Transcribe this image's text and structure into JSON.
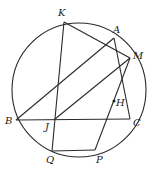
{
  "diagram": {
    "circle": {
      "cx": 79,
      "cy": 90,
      "r": 67
    },
    "points": {
      "K": {
        "label": "K",
        "x": 64,
        "y": 22,
        "lx": 58,
        "ly": 16
      },
      "A": {
        "label": "A",
        "x": 114,
        "y": 38,
        "lx": 113,
        "ly": 33
      },
      "M": {
        "label": "M",
        "x": 130,
        "y": 58,
        "lx": 133,
        "ly": 59
      },
      "B": {
        "label": "B",
        "x": 16,
        "y": 120,
        "lx": 5,
        "ly": 124
      },
      "C": {
        "label": "C",
        "x": 130,
        "y": 119,
        "lx": 133,
        "ly": 126
      },
      "J": {
        "label": "J",
        "x": 55,
        "y": 119,
        "lx": 45,
        "ly": 130
      },
      "Q": {
        "label": "Q",
        "x": 52,
        "y": 151,
        "lx": 46,
        "ly": 163
      },
      "P": {
        "label": "P",
        "x": 95,
        "y": 150,
        "lx": 96,
        "ly": 163
      },
      "H": {
        "label": "H",
        "x": 114,
        "y": 101,
        "lx": 116,
        "ly": 106
      }
    },
    "segments": [
      [
        "K",
        "Q"
      ],
      [
        "K",
        "M"
      ],
      [
        "B",
        "A"
      ],
      [
        "J",
        "M"
      ],
      [
        "A",
        "C"
      ],
      [
        "M",
        "P"
      ],
      [
        "Q",
        "P"
      ],
      [
        "B",
        "C"
      ]
    ]
  }
}
